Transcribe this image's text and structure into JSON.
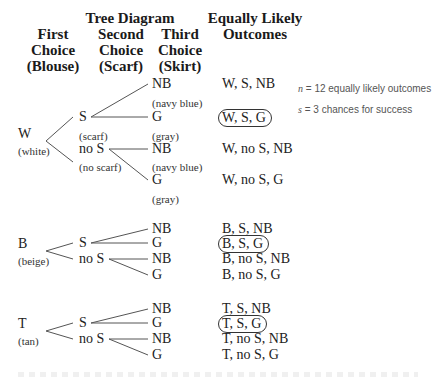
{
  "headers": {
    "tree_title": "Tree Diagram",
    "col1": [
      "First",
      "Choice",
      "(Blouse)"
    ],
    "col2": [
      "Second",
      "Choice",
      "(Scarf)"
    ],
    "col3": [
      "Third",
      "Choice",
      "(Skirt)"
    ],
    "outcomes": [
      "Equally Likely",
      "Outcomes"
    ]
  },
  "groups": [
    {
      "first": {
        "label": "W",
        "desc": "(white)"
      },
      "second": [
        {
          "label": "S",
          "desc": "(scarf)"
        },
        {
          "label": "no S",
          "desc": "(no scarf)"
        }
      ],
      "third": [
        {
          "label": "NB",
          "desc": "(navy blue)"
        },
        {
          "label": "G",
          "desc": "(gray)"
        },
        {
          "label": "NB",
          "desc": "(navy blue)"
        },
        {
          "label": "G",
          "desc": "(gray)"
        }
      ],
      "outcomes": [
        {
          "text": "W, S, NB",
          "circled": false
        },
        {
          "text": "W, S, G",
          "circled": true
        },
        {
          "text": "W, no S, NB",
          "circled": false
        },
        {
          "text": "W, no S, G",
          "circled": false
        }
      ]
    },
    {
      "first": {
        "label": "B",
        "desc": "(beige)"
      },
      "second": [
        {
          "label": "S"
        },
        {
          "label": "no S"
        }
      ],
      "third": [
        {
          "label": "NB"
        },
        {
          "label": "G"
        },
        {
          "label": "NB"
        },
        {
          "label": "G"
        }
      ],
      "outcomes": [
        {
          "text": "B, S, NB",
          "circled": false
        },
        {
          "text": "B, S, G",
          "circled": true
        },
        {
          "text": "B, no S, NB",
          "circled": false
        },
        {
          "text": "B, no S, G",
          "circled": false
        }
      ]
    },
    {
      "first": {
        "label": "T",
        "desc": "(tan)"
      },
      "second": [
        {
          "label": "S"
        },
        {
          "label": "no S"
        }
      ],
      "third": [
        {
          "label": "NB"
        },
        {
          "label": "G"
        },
        {
          "label": "NB"
        },
        {
          "label": "G"
        }
      ],
      "outcomes": [
        {
          "text": "T, S, NB",
          "circled": false
        },
        {
          "text": "T, S, G",
          "circled": true
        },
        {
          "text": "T, no S, NB",
          "circled": false
        },
        {
          "text": "T, no S, G",
          "circled": false
        }
      ]
    }
  ],
  "notes": {
    "n_var": "n",
    "n_text": " = 12 equally likely outcomes",
    "s_var": "s",
    "s_text": " = 3 chances for success"
  }
}
